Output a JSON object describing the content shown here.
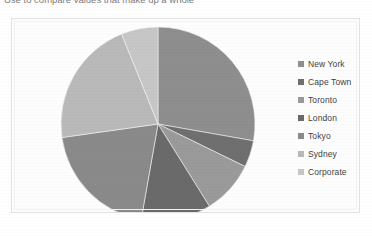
{
  "caption": {
    "text": "Use to compare values that make up a whole"
  },
  "chart_frame": {
    "background": "#fdfdfd",
    "border_color": "#e2e2e2"
  },
  "legend": {
    "position": "right",
    "items": [
      {
        "label": "New York",
        "color": "#8e8e8e"
      },
      {
        "label": "Cape Town",
        "color": "#6f6f6f"
      },
      {
        "label": "Toronto",
        "color": "#9a9a9a"
      },
      {
        "label": "London",
        "color": "#6a6a6a"
      },
      {
        "label": "Tokyo",
        "color": "#8a8a8a"
      },
      {
        "label": "Sydney",
        "color": "#b9b9b9"
      },
      {
        "label": "Corporate",
        "color": "#c6c6c6"
      }
    ]
  },
  "chart_data": {
    "type": "pie",
    "title": "",
    "subtitle": "",
    "xlabel": "",
    "ylabel": "",
    "grid": false,
    "legend_position": "right",
    "start_angle_deg": 0,
    "direction": "clockwise",
    "center": {
      "x": 146,
      "y": 105
    },
    "radius": 97,
    "categories": [
      "New York",
      "Cape Town",
      "Toronto",
      "London",
      "Tokyo",
      "Sydney",
      "Corporate"
    ],
    "values": [
      25.0,
      4.0,
      8.0,
      10.5,
      18.0,
      19.0,
      5.5
    ],
    "percentages": [
      27.8,
      4.4,
      8.9,
      11.7,
      20.0,
      21.1,
      6.1
    ],
    "slice_angles_deg": [
      100.0,
      16.0,
      32.0,
      42.0,
      72.0,
      76.0,
      22.0
    ],
    "colors": [
      "#8e8e8e",
      "#6f6f6f",
      "#9a9a9a",
      "#6a6a6a",
      "#8a8a8a",
      "#b9b9b9",
      "#c6c6c6"
    ],
    "series": [
      {
        "name": "Share",
        "values": [
          25.0,
          4.0,
          8.0,
          10.5,
          18.0,
          19.0,
          5.5
        ]
      }
    ]
  }
}
